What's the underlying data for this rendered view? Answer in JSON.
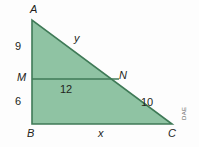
{
  "figure": {
    "colors": {
      "fill": "#8fc3a3",
      "stroke": "#3f7a57",
      "background": "#fdfdfd",
      "text": "#231f20",
      "credit_text": "#5c5c5c"
    },
    "vertices": [
      {
        "id": "A",
        "label": "A",
        "x": 32,
        "y": 20
      },
      {
        "id": "B",
        "label": "B",
        "x": 32,
        "y": 124
      },
      {
        "id": "C",
        "label": "C",
        "x": 172,
        "y": 124
      },
      {
        "id": "M",
        "label": "M",
        "x": 32,
        "y": 79
      },
      {
        "id": "N",
        "label": "N",
        "x": 119,
        "y": 79
      }
    ],
    "measures": {
      "am": "9",
      "mb": "6",
      "mn": "12",
      "nc": "10",
      "an": "y",
      "bc": "x"
    },
    "credit": "DAE"
  }
}
